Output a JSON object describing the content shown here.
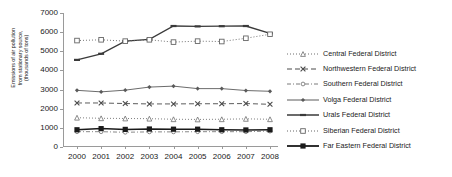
{
  "chart_data": {
    "type": "line",
    "title": "",
    "xlabel": "",
    "ylabel": "Emissions of air pollution\nfrom stationary source,\n(thousands of tons)",
    "x": [
      2000,
      2001,
      2002,
      2003,
      2004,
      2005,
      2006,
      2007,
      2008
    ],
    "xticklabels": [
      "2000",
      "2001",
      "2002",
      "2003",
      "2004",
      "2005",
      "2006",
      "2007",
      "2008"
    ],
    "ylim": [
      0,
      7000
    ],
    "yticks": [
      0,
      1000,
      2000,
      3000,
      4000,
      5000,
      6000,
      7000
    ],
    "yticklabels": [
      "0",
      "1000",
      "2000",
      "3000",
      "4000",
      "5000",
      "6000",
      "7000"
    ],
    "grid": false,
    "legend_position": "right",
    "series": [
      {
        "name": "Central Federal District",
        "values": [
          1530,
          1500,
          1490,
          1480,
          1450,
          1440,
          1450,
          1470,
          1450
        ],
        "color": "#6e6e6e",
        "marker": "triangle",
        "dash": "1,2"
      },
      {
        "name": "Northwestern Federal District",
        "values": [
          2300,
          2300,
          2270,
          2250,
          2250,
          2260,
          2260,
          2270,
          2230
        ],
        "color": "#4a4a4a",
        "marker": "x",
        "dash": "5,3"
      },
      {
        "name": "Southern Federal District",
        "values": [
          800,
          800,
          770,
          790,
          790,
          800,
          800,
          800,
          830
        ],
        "color": "#7a7a7a",
        "marker": "circle-small",
        "dash": "4,2,1,2"
      },
      {
        "name": "Volga Federal District",
        "values": [
          2960,
          2880,
          2970,
          3130,
          3180,
          3050,
          3050,
          2950,
          2910
        ],
        "color": "#5a5a5a",
        "marker": "diamond",
        "dash": "none"
      },
      {
        "name": "Urals Federal District",
        "values": [
          4550,
          4870,
          5530,
          5620,
          6320,
          6300,
          6310,
          6320,
          5940
        ],
        "color": "#3a3a3a",
        "marker": "dash-bar",
        "dash": "none"
      },
      {
        "name": "Siberian Federal District",
        "values": [
          5560,
          5600,
          5530,
          5600,
          5480,
          5530,
          5510,
          5680,
          5890
        ],
        "color": "#666666",
        "marker": "square-open",
        "dash": "1,2"
      },
      {
        "name": "Far Eastern Federal District",
        "values": [
          900,
          960,
          920,
          940,
          930,
          930,
          900,
          890,
          900
        ],
        "color": "#1a1a1a",
        "marker": "square-filled",
        "dash": "none"
      }
    ]
  },
  "legend": {
    "items": [
      "Central Federal District",
      "Northwestern Federal District",
      "Southern Federal District",
      "Volga Federal District",
      "Urals Federal District",
      "Siberian Federal District",
      "Far Eastern Federal District"
    ]
  }
}
